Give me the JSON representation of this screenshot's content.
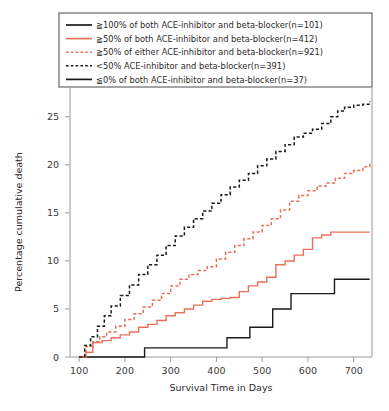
{
  "chart_data": {
    "type": "line",
    "title": "",
    "subtitle": "",
    "xlabel": "Survival Time in Days",
    "ylabel": "Percentage cumulative death",
    "xlim": [
      80,
      740
    ],
    "ylim": [
      0,
      28
    ],
    "xticks": [
      100,
      200,
      300,
      400,
      500,
      600,
      700
    ],
    "yticks": [
      0,
      5,
      10,
      15,
      20,
      25
    ],
    "grid": false,
    "legend_position": "top-left",
    "colors": {
      "black": "#1a1a1a",
      "orange": "#e8705a",
      "axis": "#9a9a9a",
      "background": "#ffffff"
    },
    "series": [
      {
        "name": "≧100% of both ACE-inhibitor and beta-blocker(n=101)",
        "label": "≧100% of both ACE-inhibitor and beta-blocker(n=101)",
        "color": "#1a1a1a",
        "dash": "solid",
        "style": "step",
        "x": [
          100,
          240,
          243,
          420,
          423,
          470,
          473,
          520,
          523,
          560,
          563,
          655,
          658,
          735
        ],
        "y": [
          0,
          0,
          0.95,
          0.95,
          2.0,
          2.0,
          3.1,
          3.1,
          5.0,
          5.0,
          6.6,
          6.6,
          8.1,
          8.1
        ]
      },
      {
        "name": "≧50% of both ACE-inhibitor and beta-blocker(n=412)",
        "label": "≧50% of both ACE-inhibitor and beta-blocker(n=412)",
        "color": "#e8705a",
        "dash": "solid",
        "style": "step",
        "x": [
          100,
          115,
          130,
          150,
          170,
          190,
          210,
          230,
          250,
          270,
          290,
          310,
          330,
          350,
          370,
          390,
          410,
          430,
          450,
          470,
          490,
          510,
          530,
          550,
          570,
          590,
          610,
          630,
          650,
          670,
          690,
          710,
          735
        ],
        "y": [
          0,
          0.5,
          1.5,
          1.7,
          2.0,
          2.3,
          2.6,
          3.1,
          3.4,
          3.8,
          4.3,
          4.6,
          5.0,
          5.4,
          5.8,
          6.0,
          6.1,
          6.2,
          6.8,
          7.4,
          7.8,
          8.3,
          9.6,
          10.0,
          10.6,
          11.2,
          12.4,
          12.7,
          13.0,
          13.0,
          13.0,
          13.0,
          13.0
        ]
      },
      {
        "name": "≧50% of either ACE-inhibitor and beta-blocker(n=921)",
        "label": "≧50% of either ACE-inhibitor and beta-blocker(n=921)",
        "color": "#e8705a",
        "dash": "dashed",
        "style": "step",
        "x": [
          100,
          115,
          130,
          145,
          160,
          180,
          200,
          220,
          240,
          260,
          280,
          300,
          320,
          340,
          360,
          380,
          400,
          420,
          440,
          460,
          480,
          500,
          520,
          540,
          560,
          580,
          600,
          620,
          640,
          660,
          680,
          700,
          720,
          735
        ],
        "y": [
          0,
          1.1,
          1.6,
          2.1,
          2.6,
          3.2,
          3.9,
          4.5,
          5.2,
          5.9,
          6.6,
          7.4,
          8.1,
          8.6,
          9.0,
          9.4,
          10.2,
          10.9,
          11.6,
          12.3,
          13.0,
          13.7,
          14.4,
          15.3,
          16.2,
          16.8,
          17.3,
          17.8,
          18.1,
          18.6,
          19.1,
          19.4,
          19.8,
          20.3
        ]
      },
      {
        "name": "<50% ACE-inhibitor and beta-blocker(n=391)",
        "label": "<50% ACE-inhibitor and beta-blocker(n=391)",
        "color": "#1a1a1a",
        "dash": "dashed",
        "style": "step",
        "x": [
          100,
          112,
          125,
          140,
          155,
          170,
          190,
          210,
          230,
          250,
          270,
          290,
          310,
          330,
          350,
          370,
          390,
          410,
          430,
          450,
          470,
          490,
          510,
          530,
          550,
          570,
          590,
          610,
          630,
          650,
          665,
          680,
          700,
          720,
          735
        ],
        "y": [
          0,
          1.2,
          2.1,
          3.2,
          4.3,
          5.3,
          6.4,
          7.5,
          8.6,
          9.6,
          10.6,
          11.6,
          12.6,
          13.5,
          14.4,
          15.2,
          16.0,
          16.9,
          17.7,
          18.4,
          19.1,
          19.9,
          20.6,
          21.4,
          22.1,
          22.9,
          23.3,
          23.7,
          24.3,
          25.0,
          25.6,
          26.0,
          26.2,
          26.3,
          26.6
        ]
      },
      {
        "name": "≦0% of both ACE-inhibitor and beta-blocker(n=37)",
        "label": "≦0% of both ACE-inhibitor and beta-blocker(n=37)",
        "color": "#1a1a1a",
        "dash": "solid",
        "style": "step",
        "x": [],
        "y": [],
        "note": "legend-only duplicate entry"
      }
    ],
    "legend_entries": [
      {
        "label": "≧100% of both ACE-inhibitor and beta-blocker(n=101)",
        "color": "#1a1a1a",
        "dash": "solid"
      },
      {
        "label": "≧50% of both ACE-inhibitor and beta-blocker(n=412)",
        "color": "#e8705a",
        "dash": "solid"
      },
      {
        "label": "≧50% of either ACE-inhibitor and beta-blocker(n=921)",
        "color": "#e8705a",
        "dash": "dashed"
      },
      {
        "label": "<50% ACE-inhibitor and beta-blocker(n=391)",
        "color": "#1a1a1a",
        "dash": "dashed"
      },
      {
        "label": "≦0% of both ACE-inhibitor and beta-blocker(n=37)",
        "color": "#1a1a1a",
        "dash": "solid"
      }
    ]
  }
}
